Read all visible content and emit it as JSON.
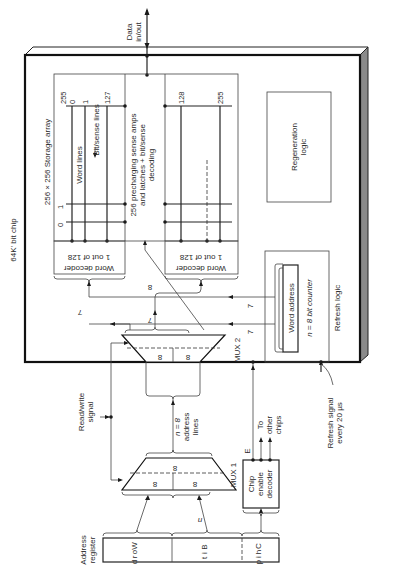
{
  "diagram": {
    "orientation": "rotated 90 degrees counter-clockwise",
    "chip": {
      "label": "64K' bit chip"
    },
    "data_io": {
      "label_line1": "Data",
      "label_line2": "in/out"
    },
    "storage_array": {
      "title": "256 × 256 Storage array",
      "word_lines_label": "Word lines",
      "bit_sense_lines_label": "Bit/sense lines",
      "left_column_labels": [
        "255",
        "0",
        "1",
        "127"
      ],
      "left_row_labels": [
        "0",
        "1"
      ],
      "right_column_labels": [
        "128",
        "255"
      ]
    },
    "sense_amps": {
      "line1": "256 precharging sense amps",
      "line2": "and latches + bit/sense",
      "line3": "decoding"
    },
    "word_decoder_left": {
      "line1": "Word decoder",
      "line2": "1 out of 128"
    },
    "word_decoder_right": {
      "line1": "Word decoder",
      "line2": "1 out of 128"
    },
    "regeneration_logic": {
      "line1": "Regeneration",
      "line2": "logic"
    },
    "refresh_logic": {
      "label": "Refresh logic",
      "counter_label": "Word address",
      "counter_size": "n = 8 bit counter"
    },
    "mux2": {
      "label": "MUX 2",
      "inputs": [
        "8",
        "8"
      ],
      "bus_labels": [
        "7",
        "7",
        "8",
        "7",
        "7"
      ]
    },
    "mux1": {
      "label": "MUX 1",
      "inputs": [
        "8",
        "8"
      ],
      "output": "8"
    },
    "read_write": {
      "line1": "Read/write",
      "line2": "signal"
    },
    "address_lines": {
      "line1": "n = 8",
      "line2": "address",
      "line3": "lines"
    },
    "address_register": {
      "label_line1": "Address",
      "label_line2": "register",
      "fields": [
        {
          "name": "Word",
          "letters": [
            "W",
            "o",
            "r",
            "d"
          ]
        },
        {
          "name": "Bit",
          "letters": [
            "B",
            "i",
            "t"
          ]
        },
        {
          "name": "Chip",
          "letters": [
            "C",
            "h",
            "i",
            "p"
          ]
        }
      ],
      "bit_bus_label": "n"
    },
    "chip_enable_decoder": {
      "line1": "Chip",
      "line2": "enable",
      "line3": "decoder",
      "enable_label": "E",
      "to_other_line1": "To",
      "to_other_line2": "other",
      "to_other_line3": "chips"
    },
    "refresh_signal": {
      "line1": "Refresh signal",
      "line2": "every 20 µs"
    },
    "colors": {
      "ink": "#1a1a1a",
      "chip_edge": "#8a8a8a",
      "background": "#ffffff"
    }
  }
}
